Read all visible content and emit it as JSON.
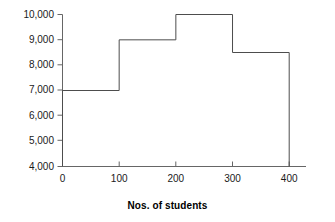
{
  "chart_data": {
    "type": "bar",
    "title": "",
    "subtitle": "",
    "xlabel": "Nos. of students",
    "ylabel": "",
    "bin_edges": [
      0,
      100,
      200,
      300,
      400
    ],
    "categories": [
      "0-100",
      "100-200",
      "200-300",
      "300-400"
    ],
    "values": [
      7000,
      9000,
      10000,
      8500
    ],
    "xlim": [
      0,
      400
    ],
    "ylim": [
      4000,
      10000
    ],
    "xticks": [
      0,
      100,
      200,
      300,
      400
    ],
    "xtick_labels": [
      "0",
      "100",
      "200",
      "300",
      "400"
    ],
    "yticks": [
      4000,
      5000,
      6000,
      7000,
      8000,
      9000,
      10000
    ],
    "ytick_labels": [
      "4,000",
      "5,000",
      "6,000",
      "7,000",
      "8,000",
      "9,000",
      "10,000"
    ],
    "grid": false,
    "legend": null,
    "bar_style": "outline",
    "series": [
      {
        "name": "frequency",
        "values": [
          7000,
          9000,
          10000,
          8500
        ]
      }
    ],
    "colors": {
      "axis": "#555555",
      "bar_outline": "#4d4d4d",
      "text": "#1a1a1a",
      "background": "#ffffff"
    },
    "annotations": []
  }
}
